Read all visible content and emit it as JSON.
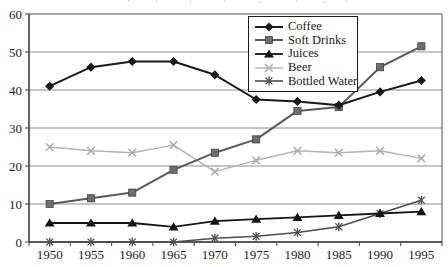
{
  "chart_data": {
    "type": "line",
    "title": "",
    "xlabel": "",
    "ylabel": "",
    "categories": [
      "1950",
      "1955",
      "1960",
      "1965",
      "1970",
      "1975",
      "1980",
      "1985",
      "1990",
      "1995"
    ],
    "y_ticks": [
      "0",
      "10",
      "20",
      "30",
      "40",
      "50",
      "60"
    ],
    "ylim": [
      0,
      60
    ],
    "grid": "horizontal",
    "legend_position": "top-center-inside",
    "background_color": "#ffffff",
    "gridline_color": "#8c8c8c",
    "frame_color": "#707070",
    "axis_color": "#404040",
    "series": [
      {
        "name": "Coffee",
        "marker": "diamond",
        "color": "#1a1a1a",
        "marker_color": "#1a1a1a",
        "line_width": 2,
        "values": [
          41,
          46,
          47.5,
          47.5,
          44,
          37.5,
          37,
          36,
          39.5,
          42.5
        ]
      },
      {
        "name": "Soft Drinks",
        "marker": "square",
        "color": "#595959",
        "marker_color": "#6e6e6e",
        "line_width": 2,
        "values": [
          10,
          11.5,
          13,
          19,
          23.5,
          27,
          34.5,
          35.5,
          46,
          51.5
        ]
      },
      {
        "name": "Juices",
        "marker": "triangle",
        "color": "#141414",
        "marker_color": "#141414",
        "line_width": 1.8,
        "values": [
          5,
          5,
          5,
          4,
          5.5,
          6,
          6.5,
          7,
          7.5,
          8
        ]
      },
      {
        "name": "Beer",
        "marker": "x",
        "color": "#b3b3b3",
        "marker_color": "#ababab",
        "line_width": 1.4,
        "values": [
          25,
          24,
          23.5,
          25.5,
          18.5,
          21.5,
          24,
          23.5,
          24,
          22
        ]
      },
      {
        "name": "Bottled Water",
        "marker": "asterisk",
        "color": "#4d4d4d",
        "marker_color": "#4d4d4d",
        "line_width": 1.6,
        "values": [
          0,
          0,
          0,
          0,
          1,
          1.5,
          2.5,
          4,
          7.5,
          11
        ]
      }
    ]
  }
}
